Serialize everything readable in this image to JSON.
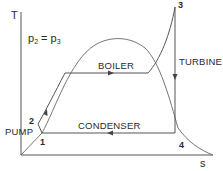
{
  "diagram": {
    "type": "T-s diagram (Rankine cycle)",
    "axes": {
      "y_label": "T",
      "x_label": "s"
    },
    "equation": {
      "lhs": "p",
      "lhs_sub": "2",
      "op": " = ",
      "rhs": "p",
      "rhs_sub": "3"
    },
    "points": {
      "p1": "1",
      "p2": "2",
      "p3": "3",
      "p4": "4"
    },
    "processes": {
      "boiler": "BOILER",
      "turbine": "TURBINE",
      "condenser": "CONDENSER",
      "pump": "PUMP"
    },
    "colors": {
      "line": "#555555",
      "text": "#2a2a2a",
      "background": "#ffffff"
    }
  }
}
